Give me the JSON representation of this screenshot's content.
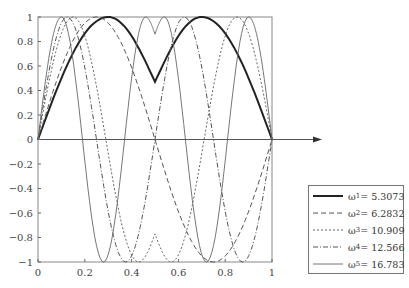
{
  "chart_data": {
    "type": "line",
    "title": "",
    "xlabel": "",
    "ylabel": "",
    "xlim": [
      0,
      1
    ],
    "ylim": [
      -1,
      1
    ],
    "x_ticks": [
      "0",
      "0.2",
      "0.4",
      "0.6",
      "0.8",
      "1"
    ],
    "y_ticks": [
      "1",
      "0.8",
      "0.6",
      "0.4",
      "0.2",
      "0",
      "−0.2",
      "−0.4",
      "−0.6",
      "−0.8",
      "−1"
    ],
    "grid": false,
    "legend_position": "lower right, outside plot",
    "series": [
      {
        "name": "ω1 = 5.3073",
        "symbol": "ω",
        "sub": "1",
        "value": "5.3073",
        "style": "thick-solid",
        "key_points": [
          [
            0,
            0
          ],
          [
            0.3,
            1
          ],
          [
            0.5,
            0.47
          ],
          [
            0.7,
            1
          ],
          [
            1,
            0
          ]
        ]
      },
      {
        "name": "ω2 = 6.2832",
        "symbol": "ω",
        "sub": "2",
        "value": "6.2832",
        "style": "dashed",
        "key_points": [
          [
            0,
            0
          ],
          [
            0.25,
            1
          ],
          [
            0.5,
            0
          ],
          [
            0.75,
            -1
          ],
          [
            1,
            0
          ]
        ]
      },
      {
        "name": "ω3 = 10.909",
        "symbol": "ω",
        "sub": "3",
        "value": "10.909",
        "style": "dotted",
        "key_points": [
          [
            0,
            0
          ],
          [
            0.15,
            1
          ],
          [
            0.43,
            -1
          ],
          [
            0.5,
            -0.77
          ],
          [
            0.57,
            -1
          ],
          [
            0.85,
            1
          ],
          [
            1,
            0
          ]
        ]
      },
      {
        "name": "ω4 = 12.566",
        "symbol": "ω",
        "sub": "4",
        "value": "12.566",
        "style": "dash-dot",
        "key_points": [
          [
            0,
            0
          ],
          [
            0.125,
            1
          ],
          [
            0.375,
            -1
          ],
          [
            0.625,
            1
          ],
          [
            0.875,
            -1
          ],
          [
            1,
            0
          ]
        ]
      },
      {
        "name": "ω5 = 16.783",
        "symbol": "ω",
        "sub": "5",
        "value": "16.783",
        "style": "thin-solid",
        "key_points": [
          [
            0,
            0
          ],
          [
            0.1,
            1
          ],
          [
            0.28,
            -1
          ],
          [
            0.46,
            1
          ],
          [
            0.5,
            0.86
          ],
          [
            0.54,
            1
          ],
          [
            0.72,
            -1
          ],
          [
            0.9,
            1
          ],
          [
            1,
            0
          ]
        ]
      }
    ]
  },
  "legend": {
    "items": [
      {
        "symbol": "ω",
        "sub": "1",
        "text": " = 5.3073"
      },
      {
        "symbol": "ω",
        "sub": "2",
        "text": " = 6.2832"
      },
      {
        "symbol": "ω",
        "sub": "3",
        "text": " = 10.909"
      },
      {
        "symbol": "ω",
        "sub": "4",
        "text": " = 12.566"
      },
      {
        "symbol": "ω",
        "sub": "5",
        "text": " = 16.783"
      }
    ]
  }
}
